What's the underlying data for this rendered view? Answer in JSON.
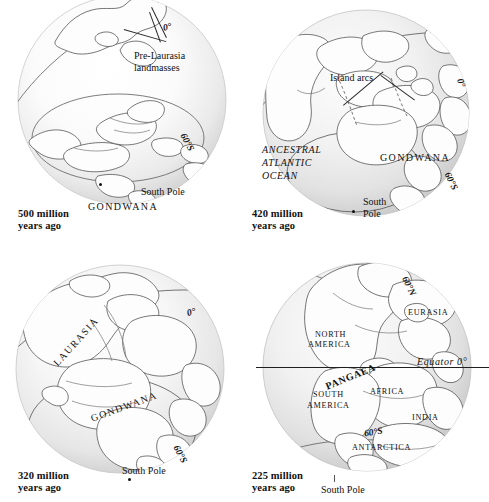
{
  "figure": {
    "type": "map-series",
    "panel_count": 4,
    "grid": "2x2"
  },
  "panels": [
    {
      "id": "panel-1",
      "age_line1": "500 million",
      "age_line2": "years ago",
      "view": "south-polar-oblique",
      "labels": [
        {
          "name": "prime-meridian",
          "text": "0°",
          "style": "lat"
        },
        {
          "name": "pre-laurasia-line1",
          "text": "Pre-Laurasia",
          "style": "plain"
        },
        {
          "name": "pre-laurasia-line2",
          "text": "landmasses",
          "style": "plain"
        },
        {
          "name": "latitude-60-south",
          "text": "60°S",
          "style": "lat"
        },
        {
          "name": "south-pole",
          "text": "South Pole",
          "style": "plain"
        },
        {
          "name": "gondwana",
          "text": "GONDWANA",
          "style": "caps"
        }
      ]
    },
    {
      "id": "panel-2",
      "age_line1": "420 million",
      "age_line2": "years ago",
      "view": "south-polar-oblique",
      "labels": [
        {
          "name": "island-arcs",
          "text": "Island arcs",
          "style": "plain"
        },
        {
          "name": "prime-meridian",
          "text": "0°",
          "style": "lat"
        },
        {
          "name": "ancestral-ocean-l1",
          "text": "ANCESTRAL",
          "style": "italic"
        },
        {
          "name": "ancestral-ocean-l2",
          "text": "ATLANTIC",
          "style": "italic"
        },
        {
          "name": "ancestral-ocean-l3",
          "text": "OCEAN",
          "style": "italic"
        },
        {
          "name": "gondwana",
          "text": "GONDWANA",
          "style": "caps"
        },
        {
          "name": "latitude-60-south",
          "text": "60°S",
          "style": "lat"
        },
        {
          "name": "south-pole-line1",
          "text": "South",
          "style": "plain"
        },
        {
          "name": "south-pole-line2",
          "text": "Pole",
          "style": "plain"
        }
      ]
    },
    {
      "id": "panel-3",
      "age_line1": "320 million",
      "age_line2": "years ago",
      "view": "south-polar-oblique",
      "labels": [
        {
          "name": "prime-meridian",
          "text": "0°",
          "style": "lat"
        },
        {
          "name": "laurasia",
          "text": "LAURASIA",
          "style": "caps"
        },
        {
          "name": "gondwana",
          "text": "GONDWANA",
          "style": "caps"
        },
        {
          "name": "latitude-60-south",
          "text": "60°S",
          "style": "lat"
        },
        {
          "name": "south-pole",
          "text": "South Pole",
          "style": "plain"
        }
      ]
    },
    {
      "id": "panel-4",
      "age_line1": "225 million",
      "age_line2": "years ago",
      "view": "equatorial-atlantic",
      "labels": [
        {
          "name": "latitude-60-north",
          "text": "60°N",
          "style": "lat"
        },
        {
          "name": "eurasia",
          "text": "EURASIA",
          "style": "caps-sm"
        },
        {
          "name": "north-america-l1",
          "text": "NORTH",
          "style": "caps-sm"
        },
        {
          "name": "north-america-l2",
          "text": "AMERICA",
          "style": "caps-sm"
        },
        {
          "name": "equator",
          "text": "Equator 0°",
          "style": "italic"
        },
        {
          "name": "pangaea",
          "text": "PANGAEA",
          "style": "bold"
        },
        {
          "name": "africa",
          "text": "AFRICA",
          "style": "caps-sm"
        },
        {
          "name": "south-america-l1",
          "text": "SOUTH",
          "style": "caps-sm"
        },
        {
          "name": "south-america-l2",
          "text": "AMERICA",
          "style": "caps-sm"
        },
        {
          "name": "india",
          "text": "INDIA",
          "style": "caps-sm"
        },
        {
          "name": "latitude-60-south",
          "text": "60°S",
          "style": "lat"
        },
        {
          "name": "antarctica",
          "text": "ANTARCTICA",
          "style": "caps-sm"
        },
        {
          "name": "south-pole",
          "text": "South Pole",
          "style": "plain"
        }
      ]
    }
  ],
  "colors": {
    "background": "#ffffff",
    "globe_light": "#fdfdfd",
    "globe_shade": "#d9d9d9",
    "coastline": "#4a4a4a",
    "graticule": "#555555",
    "text": "#111111"
  }
}
